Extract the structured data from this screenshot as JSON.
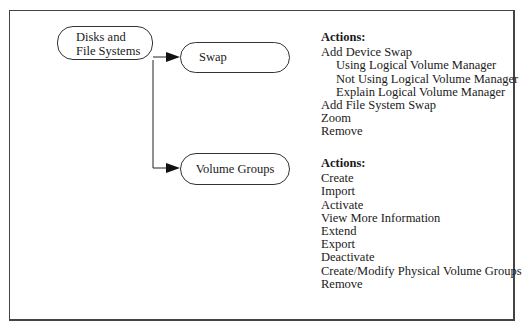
{
  "diagram": {
    "root": {
      "label_line1": "Disks and",
      "label_line2": "File Systems"
    },
    "children": [
      {
        "label": "Swap",
        "actions_title": "Actions:",
        "actions": [
          {
            "label": "Add Device Swap",
            "level": 0
          },
          {
            "label": "Using Logical Volume Manager",
            "level": 1
          },
          {
            "label": "Not Using Logical Volume Manager",
            "level": 1
          },
          {
            "label": "Explain Logical Volume Manager",
            "level": 1
          },
          {
            "label": "Add File System Swap",
            "level": 0
          },
          {
            "label": "Zoom",
            "level": 0
          },
          {
            "label": "Remove",
            "level": 0
          }
        ]
      },
      {
        "label": "Volume Groups",
        "actions_title": "Actions:",
        "actions": [
          {
            "label": "Create",
            "level": 0
          },
          {
            "label": "Import",
            "level": 0
          },
          {
            "label": "Activate",
            "level": 0
          },
          {
            "label": "View More Information",
            "level": 0
          },
          {
            "label": "Extend",
            "level": 0
          },
          {
            "label": "Export",
            "level": 0
          },
          {
            "label": "Deactivate",
            "level": 0
          },
          {
            "label": "Create/Modify Physical Volume Groups",
            "level": 0
          },
          {
            "label": "Remove",
            "level": 0
          }
        ]
      }
    ],
    "colors": {
      "line": "#222222",
      "border": "#444444",
      "background": "#ffffff"
    }
  }
}
